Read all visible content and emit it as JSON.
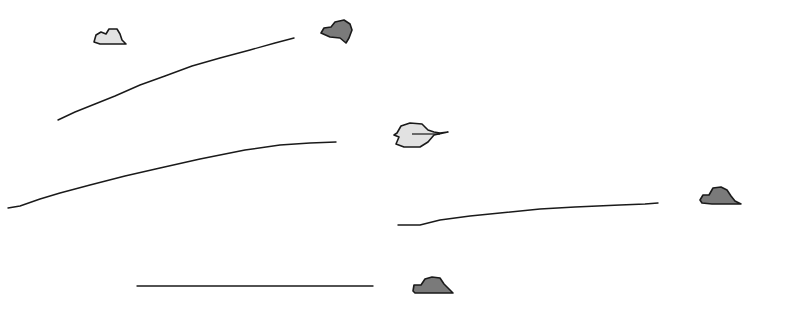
{
  "canvas": {
    "width": 785,
    "height": 311,
    "background": "#ffffff"
  },
  "colors": {
    "stroke": "#1a1a1a",
    "light_fill": "#e2e2e2",
    "dark_fill": "#7a7a7a"
  },
  "shapes": [
    {
      "id": "blob-1",
      "kind": "light",
      "points": "94,42 96,35 101,32 106,34 109,29 117,29 120,34 122,40 126,44 112,44 100,44"
    },
    {
      "id": "blob-2",
      "kind": "dark",
      "points": "321,33 324,28 331,27 335,22 344,20 350,24 352,30 349,38 346,43 340,38 330,37"
    },
    {
      "id": "blob-3",
      "kind": "light",
      "points": "397,133 401,126 410,123 422,124 428,130 434,132 440,133 448,132 434,135 428,142 420,147 404,147 396,144 399,137 394,135"
    },
    {
      "id": "blob-4",
      "kind": "dark",
      "points": "700,200 703,195 709,195 713,188 721,187 727,190 731,196 735,201 741,204 727,204 712,204 702,203"
    },
    {
      "id": "blob-5",
      "kind": "dark",
      "points": "413,291 414,285 421,285 425,279 432,277 440,278 444,284 448,288 453,293 440,293 425,293 415,293"
    }
  ],
  "lines": [
    {
      "id": "line-1",
      "points": "58,120 75,112 95,104 115,96 140,85 165,76 192,66 220,58 250,50 275,43 294,38"
    },
    {
      "id": "line-2",
      "points": "8,208 20,206 40,199 60,193 90,185 125,176 160,168 200,159 245,150 280,145 310,143 336,142"
    },
    {
      "id": "line-3",
      "points": "398,225 420,225 440,220 470,216 500,213 540,209 575,207 620,205 645,204 658,203"
    },
    {
      "id": "line-4",
      "points": "137,286 373,286"
    }
  ]
}
